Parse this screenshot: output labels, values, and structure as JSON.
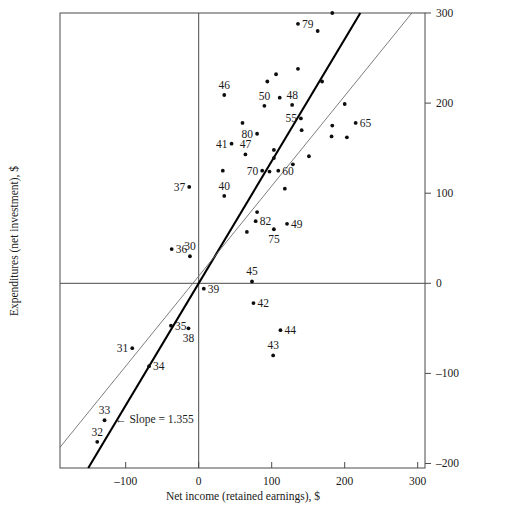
{
  "chart_data": {
    "type": "scatter",
    "title": "",
    "xlabel": "Net income (retained earnings), $",
    "ylabel": "Expenditures (net investment), $",
    "xlim": [
      -190,
      310
    ],
    "ylim": [
      -205,
      300
    ],
    "xticks": [
      -100,
      0,
      100,
      200,
      300
    ],
    "xtick_labels": [
      "–100",
      "0",
      "100",
      "200",
      "300"
    ],
    "yticks": [
      -200,
      -100,
      0,
      100,
      200,
      300
    ],
    "ytick_labels": [
      "–200",
      "–100",
      "0",
      "100",
      "200",
      "300"
    ],
    "grid": false,
    "legend": "none",
    "y_axis_side": "right",
    "annotations": [
      {
        "name": "slope-annotation",
        "text": "← Slope = 1.355",
        "x": -120,
        "y": -150
      }
    ],
    "lines": [
      {
        "name": "regression-line",
        "label": "Slope = 1.355",
        "slope": 1.355,
        "intercept": 0,
        "style": "thick-black"
      },
      {
        "name": "reference-line",
        "label": "45-degree line",
        "slope": 1.0,
        "intercept": 8,
        "style": "thin-gray"
      }
    ],
    "points": [
      {
        "label": "79",
        "x": 136,
        "y": 288,
        "label_pos": "right"
      },
      {
        "label": "",
        "x": 163,
        "y": 280,
        "label_pos": "none"
      },
      {
        "label": "",
        "x": 136,
        "y": 238,
        "label_pos": "none"
      },
      {
        "label": "",
        "x": 183,
        "y": 300,
        "label_pos": "none"
      },
      {
        "label": "",
        "x": 94,
        "y": 224,
        "label_pos": "none"
      },
      {
        "label": "",
        "x": 106,
        "y": 232,
        "label_pos": "none"
      },
      {
        "label": "46",
        "x": 35,
        "y": 209,
        "label_pos": "above"
      },
      {
        "label": "50",
        "x": 90,
        "y": 197,
        "label_pos": "above"
      },
      {
        "label": "48",
        "x": 128,
        "y": 198,
        "label_pos": "above"
      },
      {
        "label": "",
        "x": 111,
        "y": 206,
        "label_pos": "none"
      },
      {
        "label": "",
        "x": 169,
        "y": 224,
        "label_pos": "none"
      },
      {
        "label": "55",
        "x": 140,
        "y": 183,
        "label_pos": "left"
      },
      {
        "label": "65",
        "x": 215,
        "y": 178,
        "label_pos": "right"
      },
      {
        "label": "",
        "x": 200,
        "y": 199,
        "label_pos": "none"
      },
      {
        "label": "",
        "x": 183,
        "y": 175,
        "label_pos": "none"
      },
      {
        "label": "",
        "x": 60,
        "y": 178,
        "label_pos": "none"
      },
      {
        "label": "80",
        "x": 80,
        "y": 166,
        "label_pos": "left"
      },
      {
        "label": "",
        "x": 141,
        "y": 170,
        "label_pos": "none"
      },
      {
        "label": "",
        "x": 182,
        "y": 163,
        "label_pos": "none"
      },
      {
        "label": "",
        "x": 203,
        "y": 162,
        "label_pos": "none"
      },
      {
        "label": "41",
        "x": 45,
        "y": 155,
        "label_pos": "left"
      },
      {
        "label": "47",
        "x": 64,
        "y": 143,
        "label_pos": "above"
      },
      {
        "label": "",
        "x": 103,
        "y": 148,
        "label_pos": "none"
      },
      {
        "label": "",
        "x": 103,
        "y": 139,
        "label_pos": "none"
      },
      {
        "label": "",
        "x": 151,
        "y": 141,
        "label_pos": "none"
      },
      {
        "label": "70",
        "x": 87,
        "y": 125,
        "label_pos": "left"
      },
      {
        "label": "60",
        "x": 109,
        "y": 125,
        "label_pos": "right"
      },
      {
        "label": "",
        "x": 33,
        "y": 125,
        "label_pos": "none"
      },
      {
        "label": "",
        "x": 97,
        "y": 124,
        "label_pos": "none"
      },
      {
        "label": "",
        "x": 129,
        "y": 132,
        "label_pos": "none"
      },
      {
        "label": "",
        "x": 118,
        "y": 105,
        "label_pos": "none"
      },
      {
        "label": "37",
        "x": -13,
        "y": 107,
        "label_pos": "left"
      },
      {
        "label": "40",
        "x": 35,
        "y": 97,
        "label_pos": "above"
      },
      {
        "label": "82",
        "x": 78,
        "y": 69,
        "label_pos": "right"
      },
      {
        "label": "",
        "x": 80,
        "y": 79,
        "label_pos": "none"
      },
      {
        "label": "",
        "x": 66,
        "y": 57,
        "label_pos": "none"
      },
      {
        "label": "75",
        "x": 103,
        "y": 60,
        "label_pos": "below"
      },
      {
        "label": "49",
        "x": 121,
        "y": 66,
        "label_pos": "right"
      },
      {
        "label": "36",
        "x": -37,
        "y": 38,
        "label_pos": "right"
      },
      {
        "label": "30",
        "x": -12,
        "y": 30,
        "label_pos": "above"
      },
      {
        "label": "39",
        "x": 7,
        "y": -6,
        "label_pos": "right"
      },
      {
        "label": "45",
        "x": 73,
        "y": 2,
        "label_pos": "above"
      },
      {
        "label": "42",
        "x": 75,
        "y": -22,
        "label_pos": "right"
      },
      {
        "label": "35",
        "x": -38,
        "y": -47,
        "label_pos": "right"
      },
      {
        "label": "38",
        "x": -14,
        "y": -50,
        "label_pos": "below"
      },
      {
        "label": "44",
        "x": 112,
        "y": -52,
        "label_pos": "right"
      },
      {
        "label": "43",
        "x": 102,
        "y": -80,
        "label_pos": "above"
      },
      {
        "label": "31",
        "x": -91,
        "y": -72,
        "label_pos": "left"
      },
      {
        "label": "34",
        "x": -68,
        "y": -92,
        "label_pos": "right"
      },
      {
        "label": "33",
        "x": -129,
        "y": -152,
        "label_pos": "above"
      },
      {
        "label": "32",
        "x": -139,
        "y": -176,
        "label_pos": "above"
      }
    ]
  }
}
